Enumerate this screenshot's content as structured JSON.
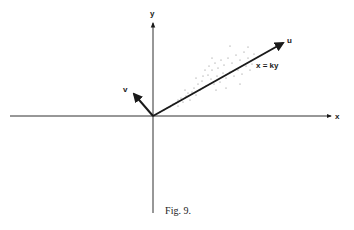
{
  "figure": {
    "caption": "Fig. 9.",
    "axes": {
      "x_label": "x",
      "y_label": "y"
    },
    "vectors": {
      "u_label": "u",
      "v_label": "v"
    },
    "line_equation": "x = ky",
    "colors": {
      "ink": "#1a1a1a",
      "background": "#ffffff",
      "scatter": "#777777"
    }
  }
}
